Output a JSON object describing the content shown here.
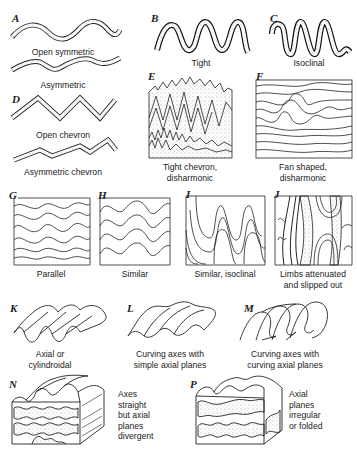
{
  "figure": {
    "panels": [
      {
        "id": "A",
        "label": "A",
        "caption": [
          "Open symmetric"
        ]
      },
      {
        "id": "A2",
        "label": "",
        "caption": [
          "Asymmetric"
        ]
      },
      {
        "id": "B",
        "label": "B",
        "caption": [
          "Tight"
        ]
      },
      {
        "id": "C",
        "label": "C",
        "caption": [
          "Isoclinal"
        ]
      },
      {
        "id": "D",
        "label": "D",
        "caption": [
          "Open chevron"
        ]
      },
      {
        "id": "D2",
        "label": "",
        "caption": [
          "Asymmetric chevron"
        ]
      },
      {
        "id": "E",
        "label": "E",
        "caption": [
          "Tight chevron,",
          "disharmonic"
        ]
      },
      {
        "id": "F",
        "label": "F",
        "caption": [
          "Fan shaped,",
          "disharmonic"
        ]
      },
      {
        "id": "G",
        "label": "G",
        "caption": [
          "Parallel"
        ]
      },
      {
        "id": "H",
        "label": "H",
        "caption": [
          "Similar"
        ]
      },
      {
        "id": "I",
        "label": "I",
        "caption": [
          "Similar, isoclinal"
        ]
      },
      {
        "id": "J",
        "label": "J",
        "caption": [
          "Limbs attenuated",
          "and slipped out"
        ]
      },
      {
        "id": "K",
        "label": "K",
        "caption": [
          "Axial or",
          "cylindroidal"
        ]
      },
      {
        "id": "L",
        "label": "L",
        "caption": [
          "Curving axes with",
          "simple axial planes"
        ]
      },
      {
        "id": "M",
        "label": "M",
        "caption": [
          "Curving axes with",
          "curving axial planes"
        ]
      },
      {
        "id": "N",
        "label": "N",
        "caption": [
          "Axes",
          "straight",
          "but axial",
          "planes",
          "divergent"
        ]
      },
      {
        "id": "P",
        "label": "P",
        "caption": [
          "Axial",
          "planes",
          "irregular",
          "or folded"
        ]
      }
    ]
  }
}
